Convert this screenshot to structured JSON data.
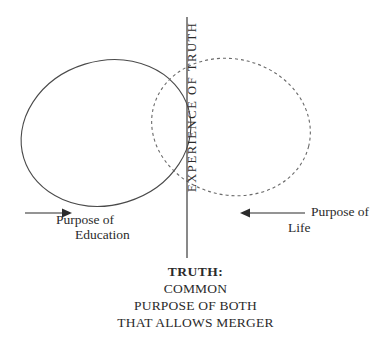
{
  "diagram": {
    "axis_label": "EXPERIENCE OF TRUTH",
    "left_label_line1": "Purpose of",
    "left_label_line2": "Education",
    "right_label_line1": "Purpose of",
    "right_label_line2": "Life",
    "caption_lines": [
      "TRUTH:",
      "COMMON",
      "PURPOSE OF BOTH",
      "THAT ALLOWS MERGER"
    ],
    "colors": {
      "ink": "#2b2b2b",
      "stroke": "#4a4a4a",
      "background": "#ffffff"
    },
    "shapes": {
      "solid_ellipse_name": "purpose-of-education-ellipse",
      "dashed_ellipse_name": "purpose-of-life-ellipse",
      "axis_name": "experience-of-truth-axis"
    }
  }
}
